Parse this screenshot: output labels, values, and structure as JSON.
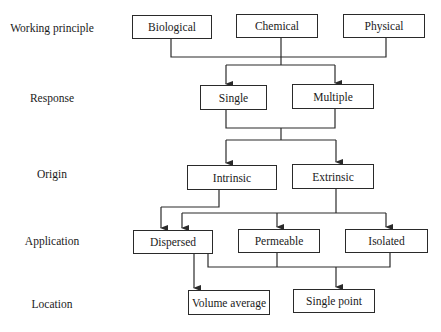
{
  "diagram": {
    "rows": [
      {
        "label": "Working principle",
        "nodes": [
          "Biological",
          "Chemical",
          "Physical"
        ]
      },
      {
        "label": "Response",
        "nodes": [
          "Single",
          "Multiple"
        ]
      },
      {
        "label": "Origin",
        "nodes": [
          "Intrinsic",
          "Extrinsic"
        ]
      },
      {
        "label": "Application",
        "nodes": [
          "Dispersed",
          "Permeable",
          "Isolated"
        ]
      },
      {
        "label": "Location",
        "nodes": [
          "Volume average",
          "Single point"
        ]
      }
    ],
    "edges": [
      {
        "from": [
          "Biological",
          "Chemical",
          "Physical"
        ],
        "to": [
          "Single",
          "Multiple"
        ]
      },
      {
        "from": [
          "Single",
          "Multiple"
        ],
        "to": [
          "Intrinsic",
          "Extrinsic"
        ]
      },
      {
        "from": [
          "Intrinsic"
        ],
        "to": [
          "Dispersed"
        ]
      },
      {
        "from": [
          "Extrinsic"
        ],
        "to": [
          "Dispersed",
          "Permeable",
          "Isolated"
        ]
      },
      {
        "from": [
          "Dispersed"
        ],
        "to": [
          "Volume average"
        ]
      },
      {
        "from": [
          "Dispersed",
          "Permeable",
          "Isolated"
        ],
        "to": [
          "Single point"
        ]
      }
    ],
    "line_color": "#2a2a2a"
  }
}
